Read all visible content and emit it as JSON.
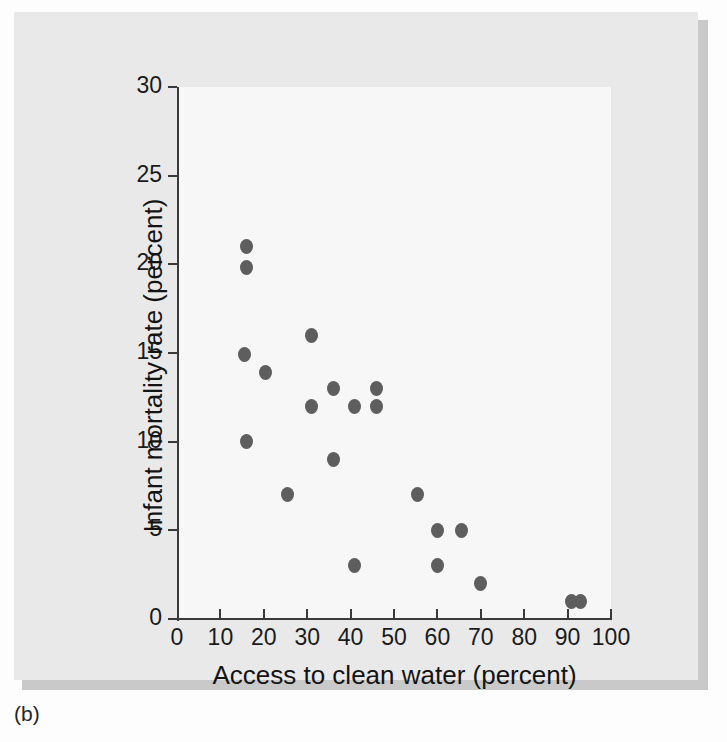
{
  "caption": "(b)",
  "chart_data": {
    "type": "scatter",
    "title": "",
    "xlabel": "Access to clean water (percent)",
    "ylabel": "Infant mortality rate (percent)",
    "xlim": [
      0,
      100
    ],
    "ylim": [
      0,
      30
    ],
    "xticks": [
      0,
      10,
      20,
      30,
      40,
      50,
      60,
      70,
      80,
      90,
      100
    ],
    "yticks": [
      0,
      5,
      10,
      15,
      20,
      25,
      30
    ],
    "grid": false,
    "legend": null,
    "marker_color": "#5e5e5e",
    "points": [
      {
        "x": 16.0,
        "y": 21.0
      },
      {
        "x": 16.0,
        "y": 19.8
      },
      {
        "x": 15.5,
        "y": 14.9
      },
      {
        "x": 20.5,
        "y": 13.9
      },
      {
        "x": 16.0,
        "y": 10.0
      },
      {
        "x": 25.5,
        "y": 7.0
      },
      {
        "x": 31.0,
        "y": 16.0
      },
      {
        "x": 31.0,
        "y": 12.0
      },
      {
        "x": 36.0,
        "y": 13.0
      },
      {
        "x": 36.0,
        "y": 9.0
      },
      {
        "x": 41.0,
        "y": 12.0
      },
      {
        "x": 41.0,
        "y": 3.0
      },
      {
        "x": 46.0,
        "y": 13.0
      },
      {
        "x": 46.0,
        "y": 12.0
      },
      {
        "x": 55.5,
        "y": 7.0
      },
      {
        "x": 60.0,
        "y": 5.0
      },
      {
        "x": 60.0,
        "y": 3.0
      },
      {
        "x": 65.5,
        "y": 5.0
      },
      {
        "x": 70.0,
        "y": 2.0
      },
      {
        "x": 91.0,
        "y": 1.0
      },
      {
        "x": 93.0,
        "y": 1.0
      }
    ]
  }
}
